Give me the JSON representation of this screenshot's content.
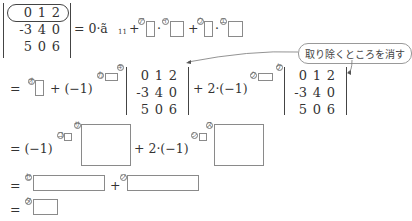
{
  "matrix": {
    "rows": [
      [
        "0",
        "1",
        "2"
      ],
      [
        "-3",
        "4",
        "0"
      ],
      [
        "5",
        "0",
        "6"
      ]
    ]
  },
  "line1": {
    "lhs_tail": "= 0·ã",
    "subscript": "11",
    "plus1": "+",
    "dot1": "·",
    "plus2": "+",
    "dot2": "·",
    "labels": [
      "ア",
      "イ",
      "ウ",
      "エ"
    ]
  },
  "callout": {
    "text": "取り除くところを消す"
  },
  "line2": {
    "eq": "=",
    "plus_neg1": "+ (−1)",
    "plus_two_neg1": "+ 2·(−1)",
    "labels": [
      "オ",
      "カ",
      "キ",
      "ク",
      "ケ"
    ]
  },
  "line3": {
    "eq_neg1": "= (−1)",
    "plus_two_neg1": "+ 2·(−1)",
    "labels": [
      "コ",
      "サ",
      "シ",
      "ス"
    ]
  },
  "line4": {
    "eq": "=",
    "plus": "+",
    "labels": [
      "セ",
      "ソ"
    ]
  },
  "line5": {
    "eq": "=",
    "labels": [
      "タ"
    ]
  }
}
